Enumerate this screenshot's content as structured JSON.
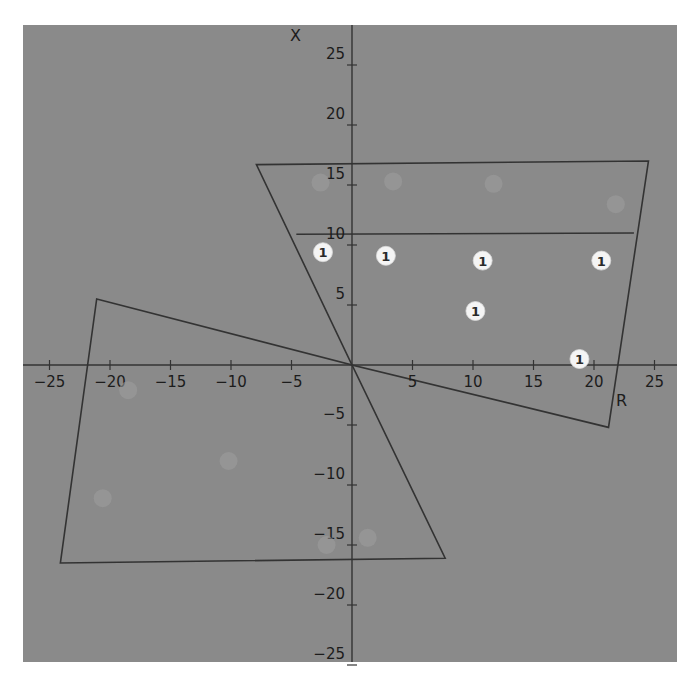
{
  "chart_data": {
    "type": "scatter",
    "title": "",
    "xlabel": "R",
    "ylabel": "X",
    "xlim": [
      -26,
      27
    ],
    "ylim": [
      -25.5,
      27
    ],
    "grid": false,
    "legend": null,
    "x_ticks": [
      -25,
      -20,
      -15,
      -10,
      -5,
      5,
      10,
      15,
      20,
      25
    ],
    "y_ticks": [
      25,
      20,
      15,
      10,
      5,
      -5,
      -10,
      -15,
      -20,
      -25
    ],
    "x_tick_labels": [
      "-25",
      "-20",
      "-15",
      "-10",
      "-5",
      "5",
      "10",
      "15",
      "20",
      "25"
    ],
    "y_tick_labels": [
      "25",
      "20",
      "15",
      "10",
      "5",
      "-5",
      "-10",
      "-15",
      "-20",
      "-25"
    ],
    "series": [
      {
        "name": "zone-1-points",
        "marker_label": "1",
        "points": [
          {
            "r": -2.4,
            "x": 9.4
          },
          {
            "r": 2.8,
            "x": 9.1
          },
          {
            "r": 10.8,
            "x": 8.7
          },
          {
            "r": 20.6,
            "x": 8.7
          },
          {
            "r": 10.2,
            "x": 4.5
          },
          {
            "r": 18.8,
            "x": 0.5
          }
        ]
      },
      {
        "name": "faint-points-upper",
        "marker_label": "2",
        "faint": true,
        "points": [
          {
            "r": -2.6,
            "x": 15.2
          },
          {
            "r": 3.4,
            "x": 15.3
          },
          {
            "r": 11.7,
            "x": 15.1
          },
          {
            "r": 21.8,
            "x": 13.4
          }
        ]
      },
      {
        "name": "faint-points-lower",
        "marker_label": "4",
        "faint": true,
        "points": [
          {
            "r": -18.5,
            "x": -2.1
          },
          {
            "r": -10.2,
            "x": -8.0
          },
          {
            "r": -20.6,
            "x": -11.1
          },
          {
            "r": -2.1,
            "x": -15.0
          },
          {
            "r": 1.3,
            "x": -14.4
          }
        ]
      }
    ],
    "shapes": [
      {
        "name": "upper-right-zone",
        "type": "polygon",
        "vertices": [
          [
            -7.9,
            16.7
          ],
          [
            24.5,
            17.0
          ],
          [
            21.2,
            -5.2
          ],
          [
            0,
            0
          ]
        ]
      },
      {
        "name": "inner-boundary-line",
        "type": "line",
        "vertices": [
          [
            -4.6,
            10.9
          ],
          [
            23.3,
            11.0
          ]
        ]
      },
      {
        "name": "lower-left-zone",
        "type": "polygon",
        "vertices": [
          [
            -21.1,
            5.5
          ],
          [
            0,
            0
          ],
          [
            7.7,
            -16.1
          ],
          [
            -24.1,
            -16.5
          ]
        ]
      }
    ]
  },
  "colors": {
    "panel_background": "#8a8a8a",
    "page_background": "#ffffff",
    "lines": "#333333",
    "marker_fill": "#f4f4f4",
    "marker_text": "#2a2a2a",
    "faint_marker": "#9e9e9e"
  }
}
